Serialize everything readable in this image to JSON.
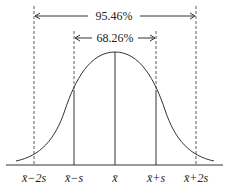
{
  "diagram": {
    "intervals": [
      {
        "label": "95.46%",
        "from": "x̄−2s",
        "to": "x̄+2s"
      },
      {
        "label": "68.26%",
        "from": "x̄−s",
        "to": "x̄+s"
      }
    ],
    "axis_labels": [
      "x̄−2s",
      "x̄−s",
      "x̄",
      "x̄+s",
      "x̄+2s"
    ],
    "colors": {
      "line": "#333333",
      "background": "#ffffff"
    }
  }
}
